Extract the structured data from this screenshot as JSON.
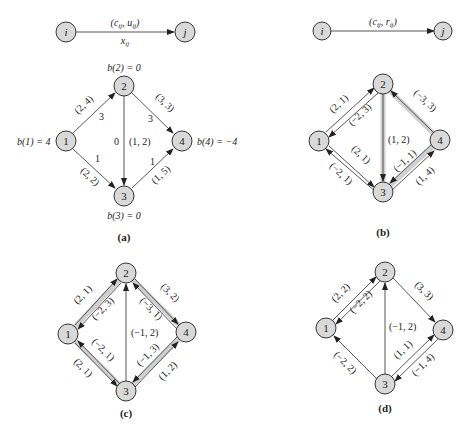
{
  "legend_a": {
    "from": "i",
    "to": "j",
    "top_label": "(c_ij, u_ij)",
    "bottom_label": "x_ij"
  },
  "legend_b": {
    "from": "i",
    "to": "j",
    "top_label": "(c_ij, r_ij)"
  },
  "panels": {
    "a": {
      "caption": "(a)",
      "supplies": {
        "b1": "b(1) = 4",
        "b2": "b(2) = 0",
        "b3": "b(3) = 0",
        "b4": "b(4) = −4"
      },
      "nodes": [
        "1",
        "2",
        "3",
        "4"
      ],
      "edges": [
        {
          "from": "1",
          "to": "2",
          "label": "(2, 4)",
          "flow": "3"
        },
        {
          "from": "1",
          "to": "3",
          "label": "(2, 2)",
          "flow": "1"
        },
        {
          "from": "2",
          "to": "3",
          "label": "(1, 2)",
          "flow": "0"
        },
        {
          "from": "2",
          "to": "4",
          "label": "(3, 3)",
          "flow": "3"
        },
        {
          "from": "3",
          "to": "4",
          "label": "(1, 5)",
          "flow": "1"
        }
      ]
    },
    "b": {
      "caption": "(b)",
      "nodes": [
        "1",
        "2",
        "3",
        "4"
      ],
      "edges": [
        {
          "from": "1",
          "to": "2",
          "label": "(2, 1)"
        },
        {
          "from": "2",
          "to": "1",
          "label": "(−2, 3)"
        },
        {
          "from": "1",
          "to": "3",
          "label": "(2, 1)"
        },
        {
          "from": "3",
          "to": "1",
          "label": "(−2, 1)"
        },
        {
          "from": "2",
          "to": "3",
          "label": "(1, 2)"
        },
        {
          "from": "4",
          "to": "2",
          "label": "(−3, 3)"
        },
        {
          "from": "4",
          "to": "3",
          "label": "(−1, 1)"
        },
        {
          "from": "3",
          "to": "4",
          "label": "(1, 4)"
        }
      ]
    },
    "c": {
      "caption": "(c)",
      "nodes": [
        "1",
        "2",
        "3",
        "4"
      ],
      "edges": [
        {
          "from": "1",
          "to": "2",
          "label": "(2, 1)"
        },
        {
          "from": "2",
          "to": "1",
          "label": "(−2, 3)"
        },
        {
          "from": "3",
          "to": "1",
          "label": "(−2, 1)"
        },
        {
          "from": "1",
          "to": "3",
          "label": "(2, 1)"
        },
        {
          "from": "3",
          "to": "2",
          "label": "(−1, 2)"
        },
        {
          "from": "2",
          "to": "4",
          "label": "(3, 2)"
        },
        {
          "from": "4",
          "to": "2",
          "label": "(−3, 1)"
        },
        {
          "from": "4",
          "to": "3",
          "label": "(−1, 3)"
        },
        {
          "from": "3",
          "to": "4",
          "label": "(1, 2)"
        }
      ]
    },
    "d": {
      "caption": "(d)",
      "nodes": [
        "1",
        "2",
        "3",
        "4"
      ],
      "edges": [
        {
          "from": "1",
          "to": "2",
          "label": "(2, 2)"
        },
        {
          "from": "2",
          "to": "1",
          "label": "(−2, 2)"
        },
        {
          "from": "3",
          "to": "1",
          "label": "(−2, 2)"
        },
        {
          "from": "3",
          "to": "2",
          "label": "(−1, 2)"
        },
        {
          "from": "2",
          "to": "4",
          "label": "(3, 3)"
        },
        {
          "from": "3",
          "to": "4",
          "label": "(1, 1)"
        },
        {
          "from": "4",
          "to": "3",
          "label": "(−1, 4)"
        }
      ]
    }
  }
}
